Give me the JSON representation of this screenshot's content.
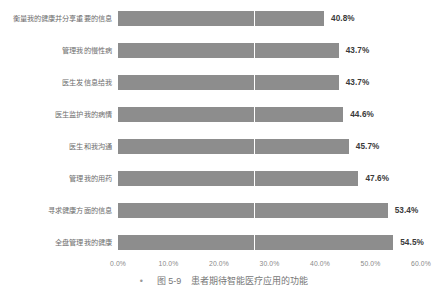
{
  "chart_data": {
    "type": "bar",
    "orientation": "horizontal",
    "title": "",
    "xlabel": "",
    "ylabel": "",
    "categories": [
      "衡量我的健康并分享重要的信息",
      "管理我的慢性病",
      "医生发信息给我",
      "医生监护我的病情",
      "医生和我沟通",
      "管理我的用药",
      "寻求健康方面的信息",
      "全盘管理我的健康"
    ],
    "values": [
      40.8,
      43.7,
      43.7,
      44.6,
      45.7,
      47.6,
      53.4,
      54.5
    ],
    "value_labels": [
      "40.8%",
      "43.7%",
      "43.7%",
      "44.6%",
      "45.7%",
      "47.6%",
      "53.4%",
      "54.5%"
    ],
    "xlim": [
      0,
      60
    ],
    "xticks": [
      0,
      10,
      20,
      30,
      40,
      50,
      60
    ],
    "xtick_labels": [
      "0.0%",
      "10.0%",
      "20.0%",
      "30.0%",
      "40.0%",
      "50.0%",
      "60.0%"
    ],
    "grid": true,
    "gridline_values": [
      27
    ],
    "legend": null,
    "bar_color": "#8d8d8d",
    "gridline_color": "#ffffff",
    "label_color": "#6d6d6d",
    "value_color": "#3a3a3a",
    "tick_color": "#8a8a8a"
  },
  "caption": {
    "bullet": "•",
    "number": "图 5-9",
    "text": "患者期待智能医疗应用的功能"
  }
}
